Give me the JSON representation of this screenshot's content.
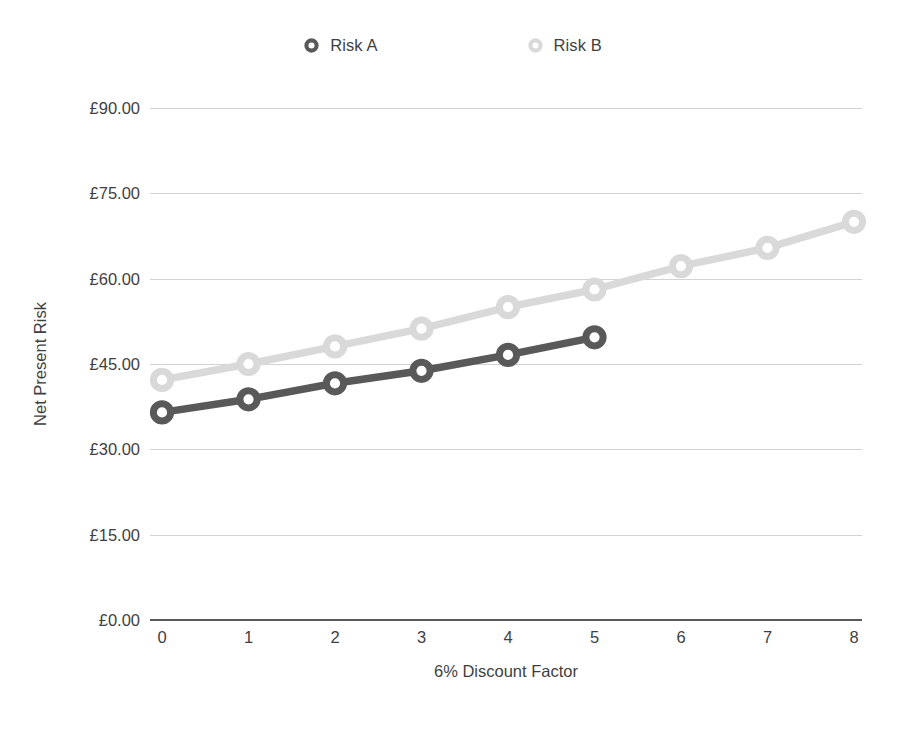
{
  "chart_data": {
    "type": "line",
    "title": "",
    "xlabel": "6% Discount Factor",
    "ylabel": "Net Present Risk",
    "x": [
      0,
      1,
      2,
      3,
      4,
      5,
      6,
      7,
      8
    ],
    "xtick_labels": [
      "0",
      "1",
      "2",
      "3",
      "4",
      "5",
      "6",
      "7",
      "8"
    ],
    "ytick_labels": [
      "£0.00",
      "£15.00",
      "£30.00",
      "£45.00",
      "£60.00",
      "£75.00",
      "£90.00"
    ],
    "ytick_values": [
      0,
      15,
      30,
      45,
      60,
      75,
      90
    ],
    "ylim": [
      0,
      90
    ],
    "xlim": [
      0,
      8
    ],
    "grid": true,
    "legend_position": "top-center",
    "currency_symbol": "£",
    "series": [
      {
        "name": "Risk A",
        "color": "#595959",
        "marker": "circle-open",
        "x": [
          0,
          1,
          2,
          3,
          4,
          5
        ],
        "values": [
          36.5,
          38.8,
          41.6,
          43.8,
          46.6,
          49.7
        ]
      },
      {
        "name": "Risk B",
        "color": "#d9d9d9",
        "marker": "circle-open",
        "x": [
          0,
          1,
          2,
          3,
          4,
          5,
          6,
          7,
          8
        ],
        "values": [
          42.2,
          45.0,
          48.1,
          51.2,
          55.0,
          58.1,
          62.2,
          65.4,
          70.0
        ]
      }
    ]
  },
  "legend": {
    "entries": [
      {
        "label": "Risk A",
        "color": "#595959"
      },
      {
        "label": "Risk B",
        "color": "#d9d9d9"
      }
    ]
  },
  "axes": {
    "x_title": "6% Discount Factor",
    "y_title": "Net Present Risk",
    "gridline_color": "#d3d3d3",
    "axis_color": "#5a5a5a",
    "background": "#ffffff"
  }
}
